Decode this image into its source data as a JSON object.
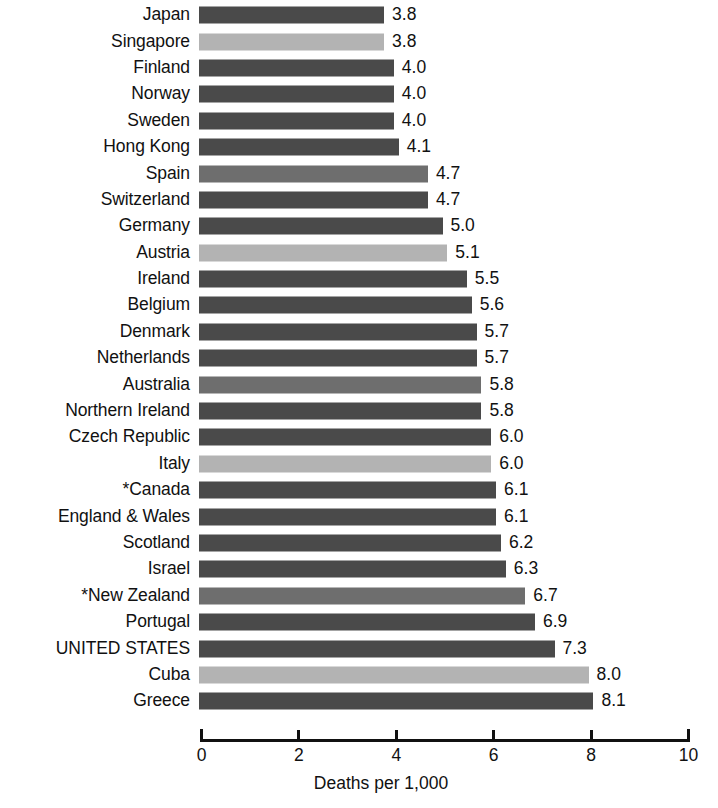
{
  "chart_data": {
    "type": "bar",
    "orientation": "horizontal",
    "title": "",
    "subtitle": "",
    "xlabel": "Deaths per 1,000",
    "ylabel": "",
    "xlim": [
      0,
      10
    ],
    "x_ticks": [
      "0",
      "2",
      "4",
      "6",
      "8",
      "10"
    ],
    "x_tick_values": [
      0,
      2,
      4,
      6,
      8,
      10
    ],
    "grid": false,
    "legend": false,
    "value_labels": true,
    "value_label_format": "one-decimal",
    "footnote_marker": "*",
    "categories": [
      "Japan",
      "Singapore",
      "Finland",
      "Norway",
      "Sweden",
      "Hong Kong",
      "Spain",
      "Switzerland",
      "Germany",
      "Austria",
      "Ireland",
      "Belgium",
      "Denmark",
      "Netherlands",
      "Australia",
      "Northern Ireland",
      "Czech Republic",
      "Italy",
      "*Canada",
      "England & Wales",
      "Scotland",
      "Israel",
      "*New Zealand",
      "Portugal",
      "UNITED STATES",
      "Cuba",
      "Greece"
    ],
    "values": [
      3.8,
      3.8,
      4.0,
      4.0,
      4.0,
      4.1,
      4.7,
      4.7,
      5.0,
      5.1,
      5.5,
      5.6,
      5.7,
      5.7,
      5.8,
      5.8,
      6.0,
      6.0,
      6.1,
      6.1,
      6.2,
      6.3,
      6.7,
      6.9,
      7.3,
      8.0,
      8.1
    ],
    "value_labels_text": [
      "3.8",
      "3.8",
      "4.0",
      "4.0",
      "4.0",
      "4.1",
      "4.7",
      "4.7",
      "5.0",
      "5.1",
      "5.5",
      "5.6",
      "5.7",
      "5.7",
      "5.8",
      "5.8",
      "6.0",
      "6.0",
      "6.1",
      "6.1",
      "6.2",
      "6.3",
      "6.7",
      "6.9",
      "7.3",
      "8.0",
      "8.1"
    ],
    "shades": [
      "dark",
      "light",
      "dark",
      "dark",
      "dark",
      "dark",
      "medium",
      "dark",
      "dark",
      "light",
      "dark",
      "dark",
      "dark",
      "dark",
      "medium",
      "dark",
      "dark",
      "light",
      "dark",
      "dark",
      "dark",
      "dark",
      "medium",
      "dark",
      "dark",
      "light",
      "dark"
    ],
    "colors": {
      "bar_dark": "#4a4a4a",
      "bar_medium": "#6e6e6e",
      "bar_light": "#b3b3b3",
      "axis": "#111111",
      "text": "#111111",
      "background": "#ffffff"
    }
  }
}
